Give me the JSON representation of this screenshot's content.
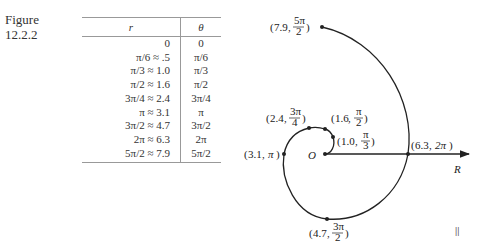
{
  "figure": {
    "label_line1": "Figure",
    "label_line2": "12.2.2"
  },
  "table": {
    "headers": [
      "r",
      "θ"
    ],
    "rows": [
      [
        "0",
        "0"
      ],
      [
        "π/6 ≈  .5",
        "π/6"
      ],
      [
        "π/3 ≈ 1.0",
        "π/3"
      ],
      [
        "π/2 ≈ 1.6",
        "π/2"
      ],
      [
        "3π/4 ≈ 2.4",
        "3π/4"
      ],
      [
        "π ≈ 3.1",
        "π"
      ],
      [
        "3π/2 ≈ 4.7",
        "3π/2"
      ],
      [
        "2π ≈ 6.3",
        "2π"
      ],
      [
        "5π/2 ≈ 7.9",
        "5π/2"
      ]
    ]
  },
  "plot": {
    "origin_label": "O",
    "axis_label": "R",
    "points": [
      {
        "r": "1.0",
        "theta_num": "π",
        "theta_den": "3"
      },
      {
        "r": "1.6",
        "theta_num": "π",
        "theta_den": "2"
      },
      {
        "r": "2.4",
        "theta_num": "3π",
        "theta_den": "4"
      },
      {
        "r": "3.1",
        "theta": "π"
      },
      {
        "r": "4.7",
        "theta_num": "3π",
        "theta_den": "2"
      },
      {
        "r": "6.3",
        "theta": "2π"
      },
      {
        "r": "7.9",
        "theta_num": "5π",
        "theta_den": "2"
      }
    ],
    "corner_mark": "||"
  }
}
